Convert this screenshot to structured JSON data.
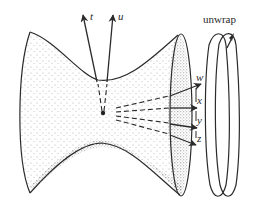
{
  "diagram": {
    "labels": {
      "t": "t",
      "u": "u",
      "w": "w",
      "x": "x",
      "y": "y",
      "z": "z",
      "unwrap": "unwrap"
    },
    "colors": {
      "ink": "#2b2b2b",
      "background": "#ffffff",
      "stipple": "#555555"
    }
  }
}
